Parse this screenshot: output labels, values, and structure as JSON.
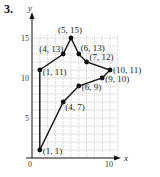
{
  "problem_number": "3.",
  "chart_data": {
    "type": "line",
    "title": "",
    "xlabel": "x",
    "ylabel": "y",
    "xlim": [
      0,
      11
    ],
    "ylim": [
      0,
      17
    ],
    "grid": true,
    "x_ticks": [
      {
        "value": 0,
        "label": "0"
      },
      {
        "value": 10,
        "label": "10"
      }
    ],
    "y_ticks": [
      {
        "value": 5,
        "label": "5"
      },
      {
        "value": 10,
        "label": "10"
      },
      {
        "value": 15,
        "label": "15"
      }
    ],
    "series": [
      {
        "name": "polygon",
        "closed": false,
        "points": [
          {
            "x": 1,
            "y": 1,
            "label": "(1, 1)"
          },
          {
            "x": 1,
            "y": 11,
            "label": "(1, 11)"
          },
          {
            "x": 4,
            "y": 13,
            "label": "(4, 13)"
          },
          {
            "x": 5,
            "y": 15,
            "label": "(5, 15)"
          },
          {
            "x": 6,
            "y": 13,
            "label": "(6, 13)"
          },
          {
            "x": 7,
            "y": 12,
            "label": "(7, 12)"
          },
          {
            "x": 10,
            "y": 11,
            "label": "(10, 11)"
          },
          {
            "x": 9,
            "y": 10,
            "label": "(9, 10)"
          },
          {
            "x": 6,
            "y": 9,
            "label": "(6, 9)"
          },
          {
            "x": 4,
            "y": 7,
            "label": "(4, 7)"
          },
          {
            "x": 1,
            "y": 1,
            "label": ""
          }
        ]
      }
    ]
  }
}
